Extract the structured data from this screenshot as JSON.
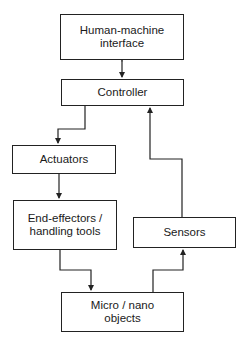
{
  "diagram": {
    "type": "block-flow",
    "nodes": {
      "hmi": {
        "line1": "Human-machine",
        "line2": "interface"
      },
      "controller": {
        "label": "Controller"
      },
      "actuators": {
        "label": "Actuators"
      },
      "end_effectors": {
        "line1": "End-effectors /",
        "line2": "handling tools"
      },
      "sensors": {
        "label": "Sensors"
      },
      "objects": {
        "line1": "Micro / nano",
        "line2": "objects"
      }
    },
    "edges": [
      {
        "from": "hmi",
        "to": "controller",
        "bidirectional": true
      },
      {
        "from": "controller",
        "to": "actuators"
      },
      {
        "from": "actuators",
        "to": "end_effectors"
      },
      {
        "from": "end_effectors",
        "to": "objects"
      },
      {
        "from": "objects",
        "to": "sensors"
      },
      {
        "from": "sensors",
        "to": "controller"
      }
    ],
    "colors": {
      "stroke": "#222222",
      "background": "#ffffff",
      "text": "#1a1a1a"
    }
  }
}
